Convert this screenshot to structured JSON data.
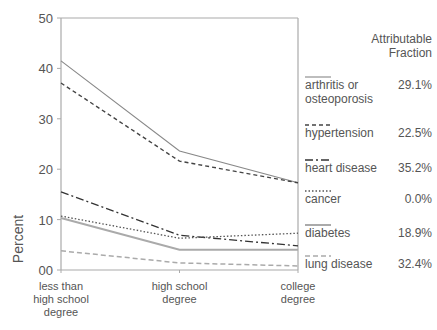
{
  "chart_data": {
    "type": "line",
    "title": "",
    "xlabel": "",
    "ylabel": "Percent",
    "ylim": [
      0,
      50
    ],
    "yticks": [
      0,
      10,
      20,
      30,
      40,
      50
    ],
    "ytick_labels": [
      "00",
      "10",
      "20",
      "30",
      "40",
      "50"
    ],
    "grid": false,
    "categories": [
      [
        "less than",
        "high school",
        "degree"
      ],
      [
        "high school",
        "degree"
      ],
      [
        "college",
        "degree"
      ]
    ],
    "legend": {
      "placement": "right",
      "title_lines": [
        "Attributable",
        "Fraction"
      ]
    },
    "series": [
      {
        "name": "arthritis or osteoporosis",
        "label_lines": [
          "arthritis or",
          "osteoporosis"
        ],
        "fraction": "29.1%",
        "values": [
          41.5,
          23.6,
          17.3
        ],
        "style": "solid",
        "color": "#888888"
      },
      {
        "name": "hypertension",
        "label_lines": [
          "hypertension"
        ],
        "fraction": "22.5%",
        "values": [
          37.1,
          21.6,
          17.3
        ],
        "style": "dashed",
        "color": "#444444"
      },
      {
        "name": "heart disease",
        "label_lines": [
          "heart disease"
        ],
        "fraction": "35.2%",
        "values": [
          15.5,
          6.9,
          4.8
        ],
        "style": "dashdot",
        "color": "#333333"
      },
      {
        "name": "cancer",
        "label_lines": [
          "cancer"
        ],
        "fraction": "0.0%",
        "values": [
          10.7,
          6.3,
          7.3
        ],
        "style": "dotted",
        "color": "#555555"
      },
      {
        "name": "diabetes",
        "label_lines": [
          "diabetes"
        ],
        "fraction": "18.9%",
        "values": [
          10.3,
          4.0,
          4.0
        ],
        "style": "solid-thick",
        "color": "#aaaaaa"
      },
      {
        "name": "lung disease",
        "label_lines": [
          "lung disease"
        ],
        "fraction": "32.4%",
        "values": [
          3.8,
          1.4,
          0.8
        ],
        "style": "dashed-light",
        "color": "#aaaaaa"
      }
    ]
  }
}
